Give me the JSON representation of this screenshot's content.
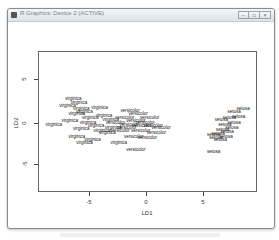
{
  "window": {
    "title": "R Graphics: Device 2 (ACTIVE)",
    "buttons": [
      {
        "name": "minimize",
        "glyph": "–"
      },
      {
        "name": "maximize",
        "glyph": "□"
      },
      {
        "name": "close",
        "glyph": "×"
      }
    ]
  },
  "chart_data": {
    "type": "scatter",
    "title": "",
    "xlabel": "LD1",
    "ylabel": "LD2",
    "xlim": [
      -9.5,
      9.7
    ],
    "ylim": [
      -8,
      8.5
    ],
    "xticks": [
      -5,
      0,
      5
    ],
    "yticks": [
      -5,
      0,
      5
    ],
    "xtick_labels": [
      "-5",
      "0",
      "5"
    ],
    "ytick_labels": [
      "-5",
      "0",
      "5"
    ],
    "grid": false,
    "legend": null,
    "marker": "text labels (species names)",
    "series": [
      {
        "name": "virginica",
        "points": [
          [
            -8.2,
            0.0
          ],
          [
            -6.5,
            3.0
          ],
          [
            -6.0,
            2.5
          ],
          [
            -7.0,
            2.2
          ],
          [
            -5.8,
            1.8
          ],
          [
            -6.2,
            1.2
          ],
          [
            -5.5,
            1.5
          ],
          [
            -5.0,
            0.8
          ],
          [
            -6.8,
            0.4
          ],
          [
            -5.2,
            0.2
          ],
          [
            -4.5,
            -0.2
          ],
          [
            -5.8,
            -0.5
          ],
          [
            -4.0,
            -0.8
          ],
          [
            -6.2,
            -1.4
          ],
          [
            -3.5,
            -1.0
          ],
          [
            -4.8,
            -1.8
          ],
          [
            -3.0,
            -0.4
          ],
          [
            -2.5,
            -2.2
          ],
          [
            -5.5,
            -2.2
          ],
          [
            -4.2,
            2.0
          ],
          [
            -3.8,
            1.0
          ],
          [
            -3.2,
            0.6
          ]
        ]
      },
      {
        "name": "versicolor",
        "points": [
          [
            -1.5,
            1.6
          ],
          [
            -0.8,
            1.2
          ],
          [
            -2.0,
            0.8
          ],
          [
            -1.0,
            0.4
          ],
          [
            -0.2,
            0.2
          ],
          [
            0.5,
            -0.2
          ],
          [
            -1.8,
            -0.4
          ],
          [
            -0.6,
            -0.8
          ],
          [
            0.8,
            -1.0
          ],
          [
            -2.4,
            -0.8
          ],
          [
            -1.2,
            -1.4
          ],
          [
            0.2,
            0.8
          ],
          [
            -0.5,
            -0.2
          ],
          [
            1.2,
            -0.4
          ],
          [
            -1.0,
            -3.0
          ],
          [
            -1.6,
            0.0
          ],
          [
            -2.8,
            0.2
          ],
          [
            0.0,
            -1.6
          ]
        ]
      },
      {
        "name": "setosa",
        "points": [
          [
            8.4,
            1.8
          ],
          [
            7.6,
            1.5
          ],
          [
            8.0,
            0.9
          ],
          [
            7.2,
            0.8
          ],
          [
            6.5,
            0.6
          ],
          [
            7.6,
            0.2
          ],
          [
            6.8,
            0.0
          ],
          [
            7.4,
            -0.4
          ],
          [
            6.6,
            -0.6
          ],
          [
            7.0,
            -0.9
          ],
          [
            6.2,
            -1.1
          ],
          [
            6.9,
            -1.4
          ],
          [
            5.8,
            -1.2
          ],
          [
            6.4,
            -1.8
          ],
          [
            6.0,
            -1.6
          ],
          [
            5.8,
            -3.2
          ]
        ]
      }
    ]
  },
  "plot": {
    "xlabel": "LD1",
    "ylabel": "LD2",
    "xticks": [
      "-5",
      "0",
      "5"
    ],
    "yticks": [
      "5",
      "0",
      "-5"
    ]
  }
}
